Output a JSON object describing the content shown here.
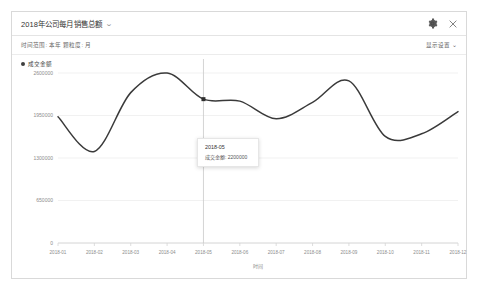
{
  "panel": {
    "title": "2018年公司每月销售总额",
    "title_caret": "⌄",
    "header_icons": [
      {
        "name": "gear-icon",
        "label": "设置"
      },
      {
        "name": "close-icon",
        "label": "关闭"
      }
    ],
    "filters": {
      "text": "时间范围: 本年   颗粒度: 月",
      "time_range_label": "时间范围:",
      "time_range_value": "本年",
      "granularity_label": "颗粒度:",
      "granularity_value": "月"
    },
    "display_settings": "显示设置 ⌄"
  },
  "legend": {
    "series_label": "成交金额",
    "dot_color": "#3f3f3f"
  },
  "tooltip": {
    "title": "2018-05",
    "metric_label": "成交金额:",
    "value": "2200000",
    "row_text": "成交金额: 2200000"
  },
  "chart_data": {
    "type": "line",
    "title": "2018年公司每月销售总额",
    "xlabel": "时间",
    "ylabel": "",
    "categories": [
      "2018-01",
      "2018-02",
      "2018-03",
      "2018-04",
      "2018-05",
      "2018-06",
      "2018-07",
      "2018-08",
      "2018-09",
      "2018-10",
      "2018-11",
      "2018-12"
    ],
    "series": [
      {
        "name": "成交金额",
        "values": [
          1930000,
          1400000,
          2300000,
          2600000,
          2200000,
          2170000,
          1900000,
          2150000,
          2480000,
          1630000,
          1670000,
          2010000
        ]
      }
    ],
    "ylim": [
      0,
      2600000
    ],
    "yticks": [
      0,
      650000,
      1300000,
      1950000,
      2600000
    ],
    "ytick_labels": [
      "0",
      "650000",
      "1300000",
      "1950000",
      "2600000"
    ],
    "grid": true,
    "legend_position": "top-left",
    "line_color": "#3a3a3a",
    "highlight": {
      "category": "2018-05",
      "value": 2200000
    }
  }
}
